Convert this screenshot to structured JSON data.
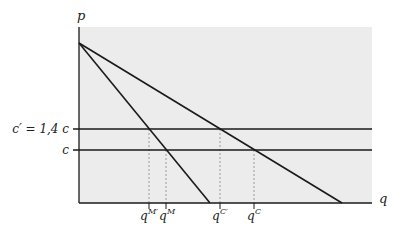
{
  "diagram": {
    "type": "economics-demand-cost",
    "axes": {
      "y_label": "p",
      "x_label": "q"
    },
    "horizontal_lines": [
      {
        "name": "c-prime",
        "label": "c′ = 1,4 c"
      },
      {
        "name": "c",
        "label": "c"
      }
    ],
    "curves": [
      {
        "name": "demand",
        "description": "demand line from p-intercept to x-axis"
      },
      {
        "name": "marginal-revenue",
        "description": "steeper line from same intercept"
      }
    ],
    "x_ticks": [
      {
        "name": "q-M-prime",
        "base": "q",
        "sup": "M′"
      },
      {
        "name": "q-M",
        "base": "q",
        "sup": "M"
      },
      {
        "name": "q-C-prime",
        "base": "q",
        "sup": "C′"
      },
      {
        "name": "q-C",
        "base": "q",
        "sup": "C"
      }
    ],
    "colors": {
      "shade": "#ececec",
      "line": "#1a1a1a",
      "dotted": "#9a9a9a"
    }
  }
}
